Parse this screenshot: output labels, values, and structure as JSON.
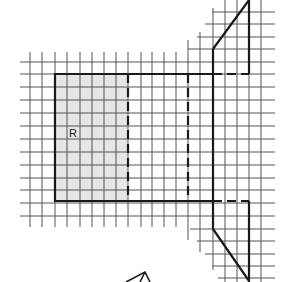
{
  "diagram": {
    "type": "net-of-solid-on-grid",
    "region_label": "R",
    "colors": {
      "grid": "#555555",
      "outline": "#1a1a1a",
      "shaded_region": "#e6e6e6",
      "background": "#ffffff"
    },
    "grid_spacing_px": 12.3,
    "shapes": [
      {
        "name": "shaded-rectangle-R",
        "description": "Shaded 6x10 rectangle labeled R"
      },
      {
        "name": "large-rectangle",
        "description": "Rectangle with two dashed fold lines"
      },
      {
        "name": "top-trapezoid-flap",
        "description": "Trapezoid attached to right edge top"
      },
      {
        "name": "bottom-trapezoid-flap",
        "description": "Trapezoid attached to right edge bottom"
      }
    ],
    "partial_figure_bottom": "arrow-shaped partial figure at bottom center"
  }
}
